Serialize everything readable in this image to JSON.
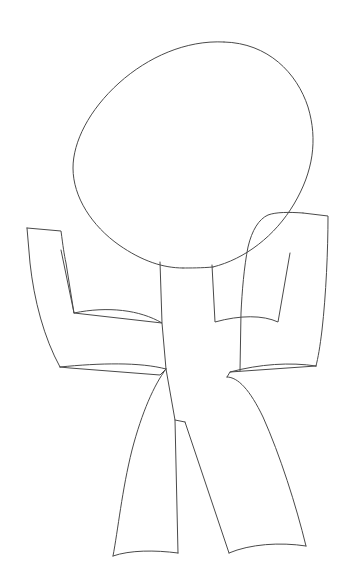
{
  "image": {
    "kind": "line-drawing",
    "subject": "human figure outline with raised arms",
    "medium": "pen on paper",
    "width": 358,
    "height": 582,
    "background_color": "#ffffff",
    "stroke_color": "#4a4a4a",
    "stroke_width": 1
  },
  "figure": {
    "parts": [
      {
        "id": "head",
        "name": "head",
        "label": "Head",
        "description": "large tilted egg-shaped oval occupying the upper half",
        "stroke_color": "#4a4a4a",
        "stroke_width": 1,
        "path": "M 224 42 C 268 43 297 73 308 107 C 318 140 313 172 294 204 C 275 236 245 259 213 267 M 224 42 C 186 40 148 57 119 83 C 89 110 73 142 73 168 C 73 197 92 226 119 245 C 142 261 163 268 183 268 M 183 268 C 190 268 202 268 213 267"
      },
      {
        "id": "left-shoulder-patch",
        "name": "left-shoulder-patch",
        "label": "Left shoulder",
        "description": "quadrilateral shoulder panel under the head on the left",
        "stroke_color": "#4a4a4a",
        "stroke_width": 1,
        "path": "M 61 250 L 74 313 C 108 306 140 310 162 323 L 160 262"
      },
      {
        "id": "right-shoulder-patch",
        "name": "right-shoulder-patch",
        "label": "Right shoulder",
        "description": "quadrilateral shoulder panel under the head on the right",
        "stroke_color": "#4a4a4a",
        "stroke_width": 1,
        "path": "M 212 265 L 215 322 C 240 315 263 315 278 322 L 290 253"
      },
      {
        "id": "left-arm",
        "name": "left-arm",
        "label": "Left arm",
        "description": "raised left arm: vertical upper arm down to elbow then forearm to hand",
        "stroke_color": "#4a4a4a",
        "stroke_width": 1,
        "path": "M 27 228 L 61 231 C 63 246 64 254 66 263 L 74 313 M 27 228 L 30 263 C 34 300 44 338 60 367 M 60 367 L 70 368 L 160 375 L 166 369 L 162 323 L 74 313"
      },
      {
        "id": "right-arm",
        "name": "right-arm",
        "label": "Right arm",
        "description": "raised right arm: vertical upper arm down to elbow then forearm to hand",
        "stroke_color": "#4a4a4a",
        "stroke_width": 1,
        "path": "M 303 213 C 289 212 276 212 268 215 C 259 219 252 230 248 247 C 244 267 242 292 241 313 L 240 371 M 303 213 L 328 216 C 328 250 326 295 322 330 C 320 347 318 358 316 366 M 316 366 L 230 372 L 227 377"
      },
      {
        "id": "torso",
        "name": "torso",
        "label": "Torso and hips",
        "description": "waist line joining the two hips",
        "stroke_color": "#4a4a4a",
        "stroke_width": 1,
        "path": "M 60 367 C 100 363 140 362 166 369 M 316 366 C 290 362 260 364 230 372"
      },
      {
        "id": "left-leg",
        "name": "left-leg",
        "label": "Left leg",
        "description": "left leg tapering from hip to foot",
        "stroke_color": "#4a4a4a",
        "stroke_width": 1,
        "path": "M 166 369 L 175 420 L 178 553 M 113 556 C 130 550 155 550 178 553 M 113 556 C 118 530 122 490 132 450 C 142 412 154 385 166 369"
      },
      {
        "id": "right-leg",
        "name": "right-leg",
        "label": "Right leg",
        "description": "right leg tapering from hip to foot",
        "stroke_color": "#4a4a4a",
        "stroke_width": 1,
        "path": "M 185 422 L 229 553 M 229 553 C 250 544 280 542 306 546 M 306 546 C 296 505 280 455 263 417 C 250 390 238 377 227 377"
      },
      {
        "id": "crotch",
        "name": "crotch",
        "label": "Crotch",
        "description": "inner leg V meeting at the crotch point",
        "stroke_color": "#4a4a4a",
        "stroke_width": 1,
        "path": "M 175 420 L 185 422"
      }
    ]
  }
}
